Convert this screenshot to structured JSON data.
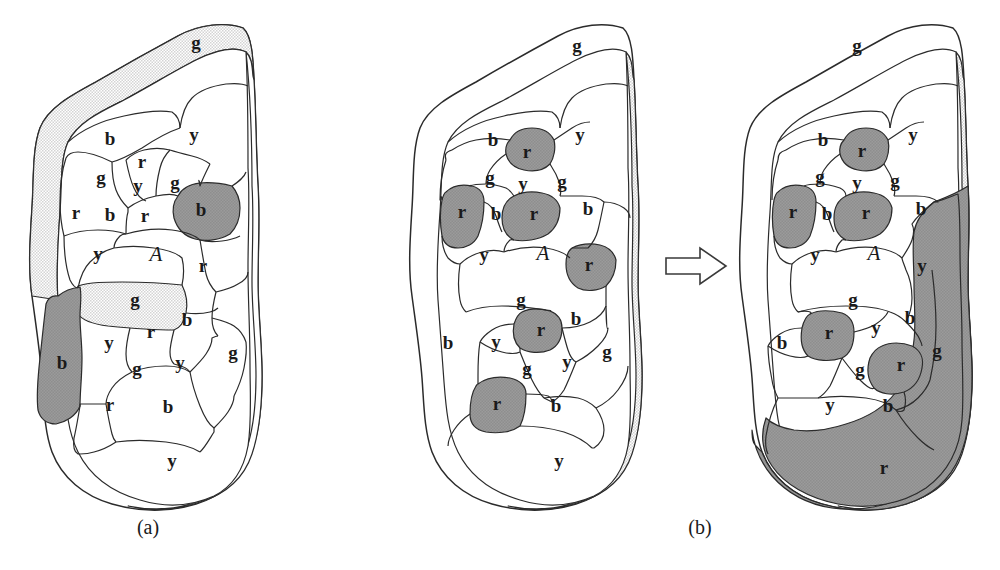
{
  "figure": {
    "captions": [
      {
        "id": "caption-a",
        "text": "(a)"
      },
      {
        "id": "caption-b",
        "text": "(b)"
      }
    ],
    "arrow": {
      "name": "transformation-arrow",
      "direction": "right"
    },
    "colors": {
      "white": "#ffffff",
      "light_gray": "#e8e8e8",
      "dark_gray": "#9a9a9a",
      "outline": "#2b2b2b",
      "label": "#1a1a1a"
    },
    "legend_keys": {
      "b": "blue",
      "r": "red",
      "g": "green",
      "y": "yellow",
      "A": "region A"
    }
  },
  "panels": [
    {
      "id": "panel-a",
      "caption": "(a)",
      "highlight_shade": "light_gray",
      "labels": [
        {
          "text": "g",
          "x": 196,
          "y": 45,
          "shade": "light_gray"
        },
        {
          "text": "b",
          "x": 110,
          "y": 141,
          "shade": "white"
        },
        {
          "text": "y",
          "x": 194,
          "y": 137,
          "shade": "white"
        },
        {
          "text": "r",
          "x": 142,
          "y": 164,
          "shade": "white"
        },
        {
          "text": "g",
          "x": 101,
          "y": 180,
          "shade": "white"
        },
        {
          "text": "y",
          "x": 138,
          "y": 188,
          "shade": "white"
        },
        {
          "text": "g",
          "x": 175,
          "y": 185,
          "shade": "white"
        },
        {
          "text": "r",
          "x": 76,
          "y": 215,
          "shade": "white"
        },
        {
          "text": "b",
          "x": 110,
          "y": 217,
          "shade": "white"
        },
        {
          "text": "r",
          "x": 145,
          "y": 218,
          "shade": "white"
        },
        {
          "text": "b",
          "x": 201,
          "y": 212,
          "shade": "dark_gray"
        },
        {
          "text": "y",
          "x": 98,
          "y": 256,
          "shade": "white"
        },
        {
          "text": "A",
          "x": 156,
          "y": 256,
          "shade": "white"
        },
        {
          "text": "r",
          "x": 203,
          "y": 268,
          "shade": "white"
        },
        {
          "text": "g",
          "x": 135,
          "y": 302,
          "shade": "light_gray"
        },
        {
          "text": "b",
          "x": 62,
          "y": 365,
          "shade": "dark_gray"
        },
        {
          "text": "y",
          "x": 109,
          "y": 345,
          "shade": "white"
        },
        {
          "text": "r",
          "x": 151,
          "y": 334,
          "shade": "white"
        },
        {
          "text": "b",
          "x": 187,
          "y": 322,
          "shade": "white"
        },
        {
          "text": "g",
          "x": 137,
          "y": 371,
          "shade": "white"
        },
        {
          "text": "y",
          "x": 180,
          "y": 365,
          "shade": "white"
        },
        {
          "text": "g",
          "x": 233,
          "y": 355,
          "shade": "white"
        },
        {
          "text": "r",
          "x": 110,
          "y": 407,
          "shade": "white"
        },
        {
          "text": "b",
          "x": 168,
          "y": 409,
          "shade": "white"
        },
        {
          "text": "y",
          "x": 172,
          "y": 463,
          "shade": "white"
        }
      ]
    },
    {
      "id": "panel-b-left",
      "caption": "",
      "highlight_shade": "dark_gray",
      "labels": [
        {
          "text": "g",
          "x": 577,
          "y": 48,
          "shade": "white"
        },
        {
          "text": "b",
          "x": 493,
          "y": 142,
          "shade": "white"
        },
        {
          "text": "r",
          "x": 527,
          "y": 154,
          "shade": "dark_gray"
        },
        {
          "text": "y",
          "x": 580,
          "y": 137,
          "shade": "white"
        },
        {
          "text": "g",
          "x": 490,
          "y": 180,
          "shade": "white"
        },
        {
          "text": "y",
          "x": 523,
          "y": 186,
          "shade": "white"
        },
        {
          "text": "g",
          "x": 562,
          "y": 184,
          "shade": "white"
        },
        {
          "text": "r",
          "x": 462,
          "y": 214,
          "shade": "dark_gray"
        },
        {
          "text": "b",
          "x": 496,
          "y": 216,
          "shade": "white"
        },
        {
          "text": "r",
          "x": 534,
          "y": 216,
          "shade": "dark_gray"
        },
        {
          "text": "b",
          "x": 588,
          "y": 211,
          "shade": "white"
        },
        {
          "text": "y",
          "x": 484,
          "y": 257,
          "shade": "white"
        },
        {
          "text": "A",
          "x": 543,
          "y": 255,
          "shade": "white"
        },
        {
          "text": "r",
          "x": 589,
          "y": 267,
          "shade": "dark_gray"
        },
        {
          "text": "g",
          "x": 521,
          "y": 302,
          "shade": "white"
        },
        {
          "text": "b",
          "x": 448,
          "y": 345,
          "shade": "white"
        },
        {
          "text": "y",
          "x": 496,
          "y": 344,
          "shade": "white"
        },
        {
          "text": "r",
          "x": 541,
          "y": 332,
          "shade": "dark_gray"
        },
        {
          "text": "b",
          "x": 576,
          "y": 321,
          "shade": "white"
        },
        {
          "text": "g",
          "x": 527,
          "y": 371,
          "shade": "white"
        },
        {
          "text": "y",
          "x": 567,
          "y": 364,
          "shade": "white"
        },
        {
          "text": "g",
          "x": 607,
          "y": 354,
          "shade": "white"
        },
        {
          "text": "r",
          "x": 497,
          "y": 406,
          "shade": "dark_gray"
        },
        {
          "text": "b",
          "x": 556,
          "y": 408,
          "shade": "white"
        },
        {
          "text": "y",
          "x": 559,
          "y": 463,
          "shade": "white"
        }
      ]
    },
    {
      "id": "panel-b-right",
      "caption": "",
      "highlight_shade": "dark_gray",
      "labels": [
        {
          "text": "g",
          "x": 857,
          "y": 48,
          "shade": "white"
        },
        {
          "text": "b",
          "x": 823,
          "y": 142,
          "shade": "white"
        },
        {
          "text": "r",
          "x": 862,
          "y": 153,
          "shade": "dark_gray"
        },
        {
          "text": "y",
          "x": 913,
          "y": 137,
          "shade": "white"
        },
        {
          "text": "g",
          "x": 820,
          "y": 179,
          "shade": "white"
        },
        {
          "text": "y",
          "x": 857,
          "y": 185,
          "shade": "white"
        },
        {
          "text": "g",
          "x": 895,
          "y": 183,
          "shade": "white"
        },
        {
          "text": "r",
          "x": 793,
          "y": 214,
          "shade": "dark_gray"
        },
        {
          "text": "b",
          "x": 827,
          "y": 216,
          "shade": "white"
        },
        {
          "text": "r",
          "x": 866,
          "y": 215,
          "shade": "dark_gray"
        },
        {
          "text": "b",
          "x": 921,
          "y": 211,
          "shade": "white"
        },
        {
          "text": "y",
          "x": 815,
          "y": 257,
          "shade": "white"
        },
        {
          "text": "A",
          "x": 874,
          "y": 255,
          "shade": "white"
        },
        {
          "text": "y",
          "x": 922,
          "y": 268,
          "shade": "white"
        },
        {
          "text": "g",
          "x": 853,
          "y": 302,
          "shade": "white"
        },
        {
          "text": "b",
          "x": 782,
          "y": 345,
          "shade": "white"
        },
        {
          "text": "r",
          "x": 829,
          "y": 335,
          "shade": "dark_gray"
        },
        {
          "text": "y",
          "x": 876,
          "y": 330,
          "shade": "white"
        },
        {
          "text": "b",
          "x": 910,
          "y": 320,
          "shade": "white"
        },
        {
          "text": "g",
          "x": 860,
          "y": 372,
          "shade": "white"
        },
        {
          "text": "r",
          "x": 901,
          "y": 367,
          "shade": "dark_gray"
        },
        {
          "text": "g",
          "x": 937,
          "y": 353,
          "shade": "white"
        },
        {
          "text": "y",
          "x": 830,
          "y": 407,
          "shade": "white"
        },
        {
          "text": "b",
          "x": 888,
          "y": 408,
          "shade": "white"
        },
        {
          "text": "r",
          "x": 884,
          "y": 470,
          "shade": "dark_gray"
        }
      ]
    }
  ]
}
